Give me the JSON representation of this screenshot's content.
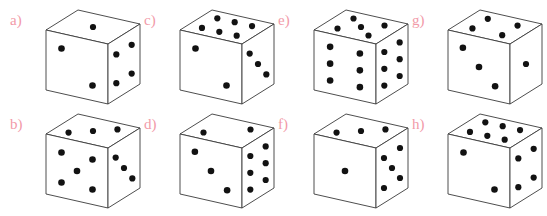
{
  "figure": {
    "title": "",
    "background_color": "#ffffff",
    "label_color": "#f29aa8",
    "die_face_color": "#ffffff",
    "die_edge_color": "#3a3a3a",
    "pip_color": "#121212",
    "layout": {
      "columns": 4,
      "rows": 2,
      "order": "row-major-pairs"
    }
  },
  "dice": [
    {
      "label": "a)",
      "name": "die-a",
      "col": 0,
      "row": 0,
      "faces": {
        "top": 1,
        "left": 2,
        "right": 4
      }
    },
    {
      "label": "b)",
      "name": "die-b",
      "col": 0,
      "row": 1,
      "faces": {
        "top": 3,
        "left": 5,
        "right": 3
      }
    },
    {
      "label": "c)",
      "name": "die-c",
      "col": 1,
      "row": 0,
      "faces": {
        "top": 6,
        "left": 2,
        "right": 3
      }
    },
    {
      "label": "d)",
      "name": "die-d",
      "col": 1,
      "row": 1,
      "faces": {
        "top": 2,
        "left": 3,
        "right": 6
      }
    },
    {
      "label": "e)",
      "name": "die-e",
      "col": 2,
      "row": 0,
      "faces": {
        "top": 5,
        "left": 6,
        "right": 6
      }
    },
    {
      "label": "f)",
      "name": "die-f",
      "col": 2,
      "row": 1,
      "faces": {
        "top": 3,
        "left": 1,
        "right": 5
      }
    },
    {
      "label": "g)",
      "name": "die-g",
      "col": 3,
      "row": 0,
      "faces": {
        "top": 4,
        "left": 3,
        "right": 1
      }
    },
    {
      "label": "h)",
      "name": "die-h",
      "col": 3,
      "row": 1,
      "faces": {
        "top": 6,
        "left": 2,
        "right": 4
      }
    }
  ]
}
